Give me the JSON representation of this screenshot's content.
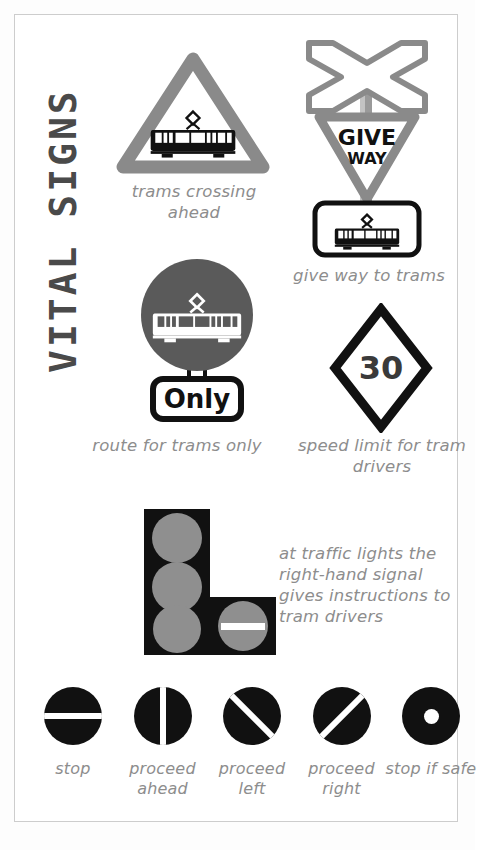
{
  "poster": {
    "title": "VITAL SIGNS",
    "colors": {
      "sign_gray": "#8a8a8a",
      "dark_gray": "#4f4f4f",
      "caption_gray": "#8d8d8d",
      "lamp_gray": "#8f8f8f",
      "black": "#111111",
      "border": "#cdcdcd",
      "background": "#ffffff"
    }
  },
  "signs": [
    {
      "id": "trams-crossing",
      "icon": "warning-triangle-tram-icon",
      "caption": "trams crossing ahead"
    },
    {
      "id": "give-way-to-trams",
      "icon": "crossbuck-give-way-tram-icon",
      "give_way_line1": "GIVE",
      "give_way_line2": "WAY",
      "caption": "give way to trams"
    },
    {
      "id": "route-for-trams-only",
      "icon": "circle-tram-only-icon",
      "plate_label": "Only",
      "caption": "route for trams only"
    },
    {
      "id": "speed-limit-tram",
      "icon": "diamond-speed-limit-icon",
      "speed_value": "30",
      "caption": "speed limit for tram drivers"
    }
  ],
  "traffic_light": {
    "icon": "tram-traffic-light-icon",
    "note": "at traffic lights the right-hand signal gives instructions to tram drivers",
    "note_lines": [
      "at traffic lights the",
      "right-hand signal",
      "gives instructions to",
      "tram drivers"
    ]
  },
  "signals": [
    {
      "id": "stop",
      "icon": "signal-horizontal-bar-icon",
      "label": "stop"
    },
    {
      "id": "proceed-ahead",
      "icon": "signal-vertical-bar-icon",
      "label": "proceed ahead"
    },
    {
      "id": "proceed-left",
      "icon": "signal-diagonal-left-icon",
      "label": "proceed left"
    },
    {
      "id": "proceed-right",
      "icon": "signal-diagonal-right-icon",
      "label": "proceed right"
    },
    {
      "id": "stop-if-safe",
      "icon": "signal-dot-icon",
      "label": "stop if safe"
    }
  ]
}
